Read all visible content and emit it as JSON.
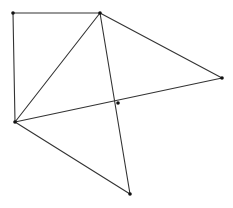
{
  "diagram": {
    "type": "geometric-figure",
    "width": 233,
    "height": 208,
    "stroke_color": "#333333",
    "point_color": "#111111",
    "background": "#ffffff",
    "points": [
      {
        "id": "A",
        "x": 13,
        "y": 13
      },
      {
        "id": "B",
        "x": 100,
        "y": 13
      },
      {
        "id": "C",
        "x": 222,
        "y": 78
      },
      {
        "id": "D",
        "x": 118,
        "y": 103
      },
      {
        "id": "E",
        "x": 15,
        "y": 122
      },
      {
        "id": "F",
        "x": 130,
        "y": 194
      }
    ],
    "segments": [
      {
        "from": "A",
        "to": "B"
      },
      {
        "from": "A",
        "to": "E"
      },
      {
        "from": "B",
        "to": "E"
      },
      {
        "from": "B",
        "to": "C"
      },
      {
        "from": "B",
        "to": "F"
      },
      {
        "from": "E",
        "to": "C"
      },
      {
        "from": "E",
        "to": "F"
      }
    ]
  }
}
